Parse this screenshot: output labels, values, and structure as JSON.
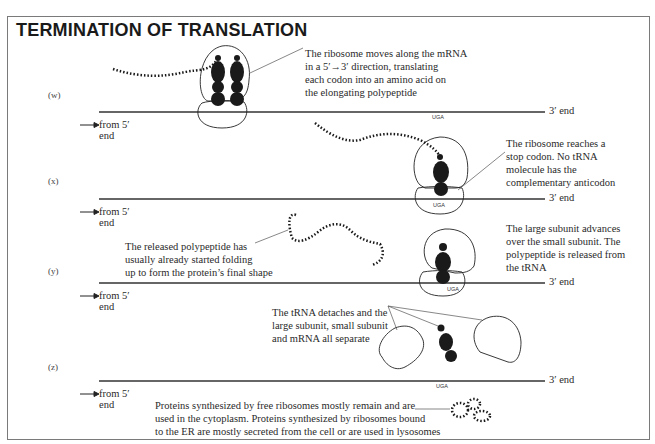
{
  "title": "TERMINATION OF TRANSLATION",
  "stages": [
    {
      "label": "(w)",
      "note": [
        "The ribosome moves along the mRNA",
        "in a 5′→3′ direction, translating",
        "each codon into an amino acid on",
        "the elongating polypeptide"
      ],
      "from_label": [
        "from 5′",
        "end"
      ],
      "end_label": "3′ end",
      "codon": "UGA"
    },
    {
      "label": "(x)",
      "note": [
        "The ribosome reaches a",
        "stop codon. No tRNA",
        "molecule has the",
        "complementary anticodon"
      ],
      "from_label": [
        "from 5′",
        "end"
      ],
      "end_label": "3′ end",
      "codon": "UGA"
    },
    {
      "label": "(y)",
      "note_left": [
        "The released polypeptide has",
        "usually already started folding",
        "up to form the protein’s final shape"
      ],
      "note": [
        "The large subunit advances",
        "over the small subunit. The",
        "polypeptide is released from",
        "the tRNA"
      ],
      "from_label": [
        "from 5′",
        "end"
      ],
      "end_label": "3′ end",
      "codon": "UGA"
    },
    {
      "label": "(z)",
      "note": [
        "The tRNA detaches and the",
        "large subunit, small subunit",
        "and mRNA all separate"
      ],
      "note_bottom": [
        "Proteins synthesized by free ribosomes mostly remain and are",
        "used in the cytoplasm. Proteins synthesized by ribosomes bound",
        "to the ER are mostly secreted from the cell or are used in lysosomes"
      ],
      "from_label": [
        "from 5′",
        "end"
      ],
      "end_label": "3′ end",
      "codon": "UGA"
    }
  ],
  "colors": {
    "ink": "#1a1a1a",
    "frame": "#7a7a7a",
    "line": "#333333"
  }
}
